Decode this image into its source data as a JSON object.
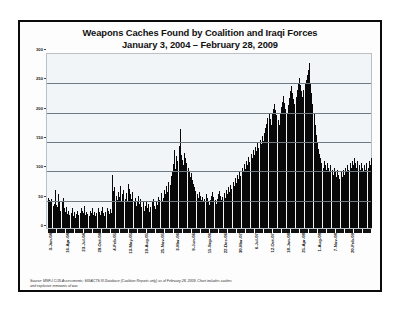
{
  "chart": {
    "title_line1": "Weapons Caches Found by Coalition and Iraqi Forces",
    "title_line2": "January 3, 2004 – February 28, 2009",
    "source_line1": "Source:  MNF-I C/J5 Assessments;  SIGACTS III Database  (Coalition Reports only) as of February 28, 2009.  Chart includes caches",
    "source_line2": "and explosive remnants of war."
  },
  "chart_data": {
    "type": "bar",
    "title": "Weapons Caches Found by Coalition and Iraqi Forces January 3, 2004 – February 28, 2009",
    "xlabel": "",
    "ylabel": "",
    "ylim": [
      0,
      300
    ],
    "yticks": [
      0,
      50,
      100,
      150,
      200,
      250,
      300
    ],
    "ytick_labels": [
      "0",
      "50",
      "100",
      "150",
      "200",
      "250",
      "300"
    ],
    "grid": true,
    "legend": "none",
    "bar_color": "#080808",
    "x_tick_labels": [
      "3-Jan-04",
      "16-Apr-04",
      "23-Jul-04",
      "29-Oct-04",
      "4-Feb-05",
      "13-May-05",
      "19-Aug-05",
      "25-Nov-05",
      "3-Mar-06",
      "9-Jun-06",
      "15-Sep-06",
      "22-Dec-06",
      "30-Mar-07",
      "6-Jul-07",
      "12-Oct-07",
      "18-Jan-08",
      "25-Apr-08",
      "1-Aug-08",
      "7-Nov-08",
      "20-Feb-09"
    ],
    "x_tick_positions": [
      0,
      15,
      29,
      43,
      57,
      71,
      85,
      99,
      113,
      127,
      141,
      155,
      169,
      183,
      197,
      211,
      225,
      239,
      253,
      268
    ],
    "x_interval": "weekly",
    "values": [
      52,
      48,
      44,
      50,
      38,
      42,
      66,
      40,
      36,
      58,
      46,
      30,
      44,
      52,
      34,
      28,
      36,
      24,
      30,
      22,
      26,
      34,
      20,
      28,
      18,
      24,
      30,
      22,
      26,
      34,
      30,
      26,
      38,
      22,
      28,
      24,
      20,
      30,
      26,
      34,
      22,
      28,
      20,
      26,
      34,
      28,
      22,
      30,
      36,
      26,
      20,
      28,
      34,
      30,
      24,
      32,
      26,
      92,
      64,
      70,
      56,
      48,
      62,
      54,
      72,
      46,
      58,
      66,
      50,
      60,
      44,
      76,
      68,
      58,
      50,
      62,
      44,
      52,
      38,
      46,
      56,
      42,
      50,
      36,
      44,
      30,
      38,
      46,
      34,
      42,
      28,
      36,
      44,
      50,
      38,
      32,
      46,
      40,
      54,
      48,
      60,
      44,
      52,
      66,
      58,
      72,
      62,
      80,
      74,
      90,
      96,
      110,
      134,
      102,
      124,
      116,
      142,
      170,
      126,
      118,
      108,
      130,
      120,
      112,
      104,
      96,
      88,
      94,
      82,
      76,
      70,
      64,
      58,
      52,
      62,
      56,
      48,
      54,
      44,
      50,
      58,
      52,
      46,
      40,
      48,
      56,
      62,
      54,
      48,
      42,
      50,
      58,
      64,
      56,
      48,
      54,
      60,
      52,
      66,
      58,
      70,
      62,
      74,
      68,
      80,
      72,
      86,
      78,
      92,
      84,
      98,
      90,
      104,
      96,
      110,
      102,
      116,
      108,
      122,
      114,
      128,
      120,
      134,
      126,
      140,
      132,
      146,
      138,
      152,
      144,
      158,
      150,
      164,
      172,
      180,
      190,
      198,
      188,
      178,
      196,
      206,
      214,
      204,
      194,
      186,
      178,
      196,
      208,
      218,
      228,
      216,
      206,
      198,
      212,
      224,
      236,
      244,
      232,
      222,
      214,
      226,
      238,
      250,
      258,
      246,
      236,
      226,
      238,
      248,
      256,
      264,
      272,
      284,
      250,
      232,
      214,
      196,
      178,
      160,
      148,
      136,
      128,
      120,
      112,
      104,
      116,
      108,
      100,
      112,
      104,
      96,
      108,
      100,
      92,
      104,
      96,
      88,
      100,
      92,
      84,
      96,
      88,
      100,
      92,
      104,
      96,
      108,
      100,
      112,
      104,
      116,
      108,
      120,
      112,
      104,
      116,
      108,
      100,
      112,
      104,
      96,
      108,
      100,
      112,
      104,
      116,
      108,
      120
    ]
  }
}
